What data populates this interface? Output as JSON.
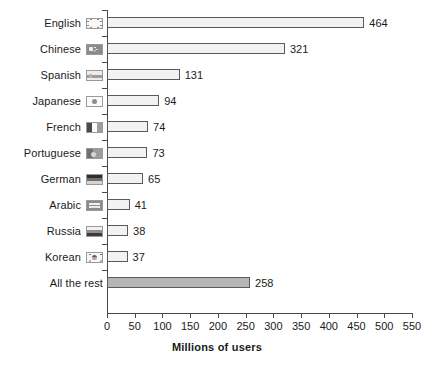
{
  "chart_data": {
    "type": "bar",
    "orientation": "horizontal",
    "title": "",
    "xlabel": "Millions of users",
    "ylabel": "",
    "xlim": [
      0,
      550
    ],
    "xticks": [
      0,
      50,
      100,
      150,
      200,
      250,
      300,
      350,
      400,
      450,
      500,
      550
    ],
    "grid": false,
    "legend": false,
    "categories": [
      "English",
      "Chinese",
      "Spanish",
      "Japanese",
      "French",
      "Portuguese",
      "German",
      "Arabic",
      "Russia",
      "Korean",
      "All the rest"
    ],
    "values": [
      464,
      321,
      131,
      94,
      74,
      73,
      65,
      41,
      38,
      37,
      258
    ],
    "bars": [
      {
        "label": "English",
        "value": 464,
        "value_text": "464",
        "flag": "flag-uk",
        "flag_name": "flag-icon-united-kingdom",
        "highlight": false
      },
      {
        "label": "Chinese",
        "value": 321,
        "value_text": "321",
        "flag": "flag-cn",
        "flag_name": "flag-icon-china",
        "highlight": false
      },
      {
        "label": "Spanish",
        "value": 131,
        "value_text": "131",
        "flag": "flag-es",
        "flag_name": "flag-icon-spain",
        "highlight": false
      },
      {
        "label": "Japanese",
        "value": 94,
        "value_text": "94",
        "flag": "flag-jp",
        "flag_name": "flag-icon-japan",
        "highlight": false
      },
      {
        "label": "French",
        "value": 74,
        "value_text": "74",
        "flag": "flag-fr",
        "flag_name": "flag-icon-france",
        "highlight": false
      },
      {
        "label": "Portuguese",
        "value": 73,
        "value_text": "73",
        "flag": "flag-pt",
        "flag_name": "flag-icon-portugal",
        "highlight": false
      },
      {
        "label": "German",
        "value": 65,
        "value_text": "65",
        "flag": "flag-de",
        "flag_name": "flag-icon-germany",
        "highlight": false
      },
      {
        "label": "Arabic",
        "value": 41,
        "value_text": "41",
        "flag": "flag-ar",
        "flag_name": "flag-icon-arabic",
        "highlight": false
      },
      {
        "label": "Russia",
        "value": 38,
        "value_text": "38",
        "flag": "flag-ru",
        "flag_name": "flag-icon-russia",
        "highlight": false
      },
      {
        "label": "Korean",
        "value": 37,
        "value_text": "37",
        "flag": "flag-kr",
        "flag_name": "flag-icon-korea",
        "highlight": false
      },
      {
        "label": "All the rest",
        "value": 258,
        "value_text": "258",
        "flag": "none",
        "flag_name": "no-flag-icon",
        "highlight": true
      }
    ],
    "colors": {
      "bar_fill": "#f2f2f2",
      "bar_fill_highlight": "#b6b6b6",
      "bar_border": "#5a5a5a",
      "axis": "#4a4a4a",
      "text": "#1a1a1a",
      "background": "#ffffff"
    }
  }
}
